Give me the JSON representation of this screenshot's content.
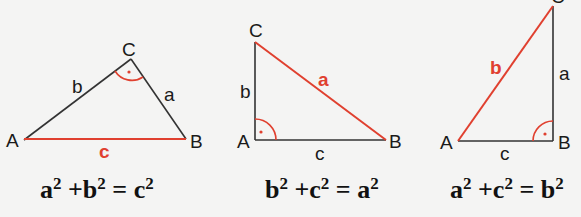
{
  "colors": {
    "edge": "#333333",
    "hypotenuse": "#e0402f",
    "right_angle_mark": "#e0402f",
    "background": "#f4f4f3"
  },
  "triangles": [
    {
      "vertices": {
        "A": "A",
        "B": "B",
        "C": "C"
      },
      "sides": {
        "a": "a",
        "b": "b",
        "c": "c"
      },
      "right_angle_at": "C",
      "hypotenuse": "c",
      "equation": {
        "t1": "a",
        "t2": "b",
        "t3": "c",
        "exp": "2",
        "plus": "+",
        "eq": "="
      }
    },
    {
      "vertices": {
        "A": "A",
        "B": "B",
        "C": "C"
      },
      "sides": {
        "a": "a",
        "b": "b",
        "c": "c"
      },
      "right_angle_at": "A",
      "hypotenuse": "a",
      "equation": {
        "t1": "b",
        "t2": "c",
        "t3": "a",
        "exp": "2",
        "plus": "+",
        "eq": "="
      }
    },
    {
      "vertices": {
        "A": "A",
        "B": "B",
        "C": "C"
      },
      "sides": {
        "a": "a",
        "b": "b",
        "c": "c"
      },
      "right_angle_at": "B",
      "hypotenuse": "b",
      "equation": {
        "t1": "a",
        "t2": "c",
        "t3": "b",
        "exp": "2",
        "plus": "+",
        "eq": "="
      }
    }
  ]
}
